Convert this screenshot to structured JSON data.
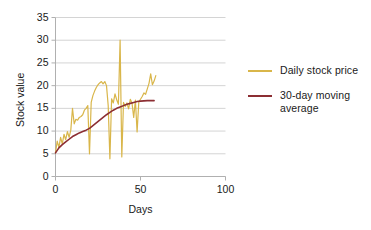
{
  "chart_data": {
    "type": "line",
    "title": "",
    "xlabel": "Days",
    "ylabel": "Stock value",
    "xlim": [
      0,
      100
    ],
    "ylim": [
      0,
      35
    ],
    "xticks": [
      "0",
      "50",
      "100"
    ],
    "xtick_values": [
      0,
      50,
      100
    ],
    "yticks": [
      "0",
      "5",
      "10",
      "15",
      "20",
      "25",
      "30",
      "35"
    ],
    "ytick_values": [
      0,
      5,
      10,
      15,
      20,
      25,
      30,
      35
    ],
    "grid": "horizontal",
    "legend_position": "right",
    "colors": {
      "daily": "#d9b64a",
      "moving_average": "#8c2e33",
      "grid": "#d4d4d4",
      "axis": "#b0b0b0",
      "text": "#1a1a1a",
      "background": "#ffffff"
    },
    "series": [
      {
        "name": "Daily stock price",
        "color": "#d9b64a",
        "x": [
          0,
          1,
          2,
          3,
          4,
          5,
          6,
          7,
          8,
          9,
          10,
          11,
          12,
          13,
          14,
          15,
          16,
          17,
          18,
          19,
          20,
          21,
          22,
          23,
          24,
          25,
          26,
          27,
          28,
          29,
          30,
          31,
          32,
          33,
          34,
          35,
          36,
          37,
          38,
          39,
          40,
          41,
          42,
          43,
          44,
          45,
          46,
          47,
          48,
          49,
          50,
          51,
          52,
          53,
          54,
          55,
          56,
          57,
          58,
          59
        ],
        "values": [
          5.2,
          7.8,
          6.4,
          8.6,
          7.2,
          9.3,
          8.1,
          9.9,
          8.6,
          10.2,
          15.0,
          11.6,
          12.6,
          12.4,
          13.0,
          13.2,
          13.6,
          14.6,
          15.0,
          15.6,
          5.0,
          16.3,
          17.8,
          18.8,
          19.6,
          20.2,
          20.6,
          20.9,
          20.4,
          20.9,
          20.0,
          15.6,
          3.9,
          17.1,
          16.2,
          18.2,
          16.9,
          15.9,
          30.0,
          4.3,
          16.3,
          15.4,
          16.2,
          14.9,
          17.0,
          16.2,
          13.0,
          16.8,
          9.8,
          16.4,
          17.0,
          17.6,
          18.4,
          18.1,
          19.3,
          20.5,
          22.6,
          20.2,
          21.0,
          22.2
        ]
      },
      {
        "name": "30-day moving average",
        "color": "#8c2e33",
        "x": [
          0,
          2,
          4,
          6,
          8,
          10,
          12,
          14,
          16,
          18,
          20,
          22,
          24,
          26,
          28,
          30,
          32,
          34,
          36,
          38,
          40,
          42,
          44,
          46,
          48,
          50,
          52,
          54,
          56,
          58
        ],
        "values": [
          5.2,
          6.3,
          7.0,
          7.6,
          8.2,
          8.8,
          9.2,
          9.6,
          9.9,
          10.2,
          10.6,
          11.2,
          11.8,
          12.4,
          13.0,
          13.6,
          14.1,
          14.6,
          15.0,
          15.3,
          15.6,
          15.9,
          16.1,
          16.3,
          16.5,
          16.6,
          16.65,
          16.7,
          16.7,
          16.7
        ]
      }
    ],
    "annotations": []
  },
  "legend": {
    "items": [
      {
        "label": "Daily stock price",
        "color": "#d9b64a"
      },
      {
        "label": "30-day moving average",
        "color": "#8c2e33"
      }
    ]
  },
  "axes": {
    "y_title": "Stock value",
    "x_title": "Days"
  }
}
